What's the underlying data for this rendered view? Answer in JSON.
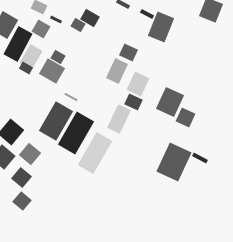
{
  "image": {
    "description": "Abstract grayscale composition of scattered tilted rectangles on a light background",
    "background_color": "#f7f7f7",
    "palette": {
      "black": "#262626",
      "dark": "#4a4a4a",
      "mid_dark": "#5e5e5e",
      "mid": "#7a7a7a",
      "light": "#a9a9a9",
      "pale": "#cdcdcd"
    }
  }
}
